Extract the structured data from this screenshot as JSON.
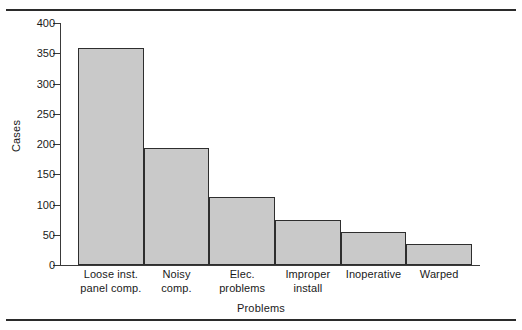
{
  "chart_data": {
    "type": "bar",
    "title": "",
    "xlabel": "Problems",
    "ylabel": "Cases",
    "categories": [
      "Loose inst. panel comp.",
      "Noisy comp.",
      "Elec. problems",
      "Improper install",
      "Inoperative",
      "Warped"
    ],
    "category_lines": [
      [
        "Loose inst.",
        "panel comp."
      ],
      [
        "Noisy",
        "comp."
      ],
      [
        "Elec.",
        "problems"
      ],
      [
        "Improper",
        "install"
      ],
      [
        "Inoperative",
        ""
      ],
      [
        "Warped",
        ""
      ]
    ],
    "values": [
      358,
      194,
      113,
      74,
      55,
      35
    ],
    "ylim": [
      0,
      400
    ],
    "yticks": [
      0,
      50,
      100,
      150,
      200,
      250,
      300,
      350,
      400
    ],
    "ytick_labels": [
      "0",
      "50",
      "100",
      "150",
      "200",
      "250",
      "300",
      "350",
      "400"
    ],
    "grid": false,
    "legend": null,
    "bar_fill_color": "#c9c9c9",
    "bar_edge_color": "#2e2e2e",
    "axis_color": "#3a3a3a",
    "text_color": "#1a1a1a",
    "background_color": "#ffffff"
  },
  "rules": {
    "top_label": "",
    "bottom_label": ""
  }
}
